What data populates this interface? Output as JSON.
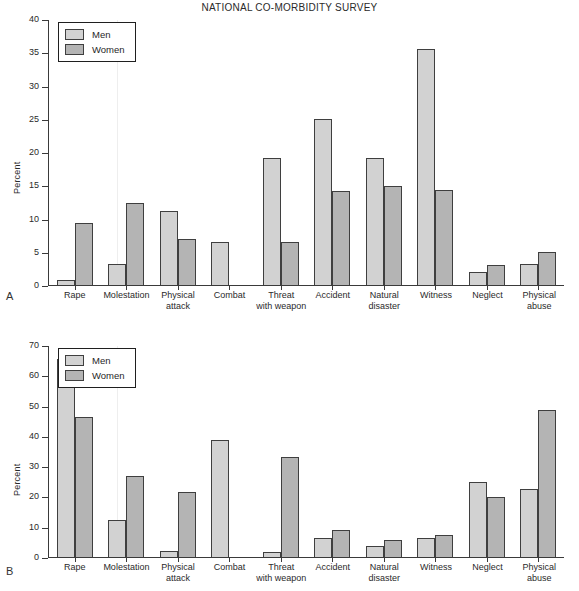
{
  "figure": {
    "title": "NATIONAL CO-MORBIDITY SURVEY",
    "panel_a_letter": "A",
    "panel_b_letter": "B",
    "colors": {
      "men": "#d2d2d2",
      "women": "#b4b4b4",
      "axis": "#3a3a3a",
      "text": "#2a2a2a",
      "background": "#ffffff"
    }
  },
  "legend": {
    "men_label": "Men",
    "women_label": "Women"
  },
  "chart_data": [
    {
      "type": "bar",
      "panel": "A",
      "title": "NATIONAL CO-MORBIDITY SURVEY",
      "xlabel": "",
      "ylabel": "Percent",
      "ylim": [
        0,
        40
      ],
      "yticks": [
        0,
        5,
        10,
        15,
        20,
        25,
        30,
        35,
        40
      ],
      "ytick_labels": [
        "0",
        "5",
        "10",
        "15",
        "20",
        "25",
        "30",
        "35",
        "40"
      ],
      "grid": false,
      "legend_position": "upper left",
      "categories": [
        "Rape",
        "Molestation",
        "Physical attack",
        "Combat",
        "Threat with weapon",
        "Accident",
        "Natural disaster",
        "Witness",
        "Neglect",
        "Physical abuse"
      ],
      "category_lines": [
        [
          "Rape"
        ],
        [
          "Molestation"
        ],
        [
          "Physical",
          "attack"
        ],
        [
          "Combat"
        ],
        [
          "Threat",
          "with weapon"
        ],
        [
          "Accident"
        ],
        [
          "Natural",
          "disaster"
        ],
        [
          "Witness"
        ],
        [
          "Neglect"
        ],
        [
          "Physical",
          "abuse"
        ]
      ],
      "series": [
        {
          "name": "Men",
          "values": [
            0.7,
            3.1,
            11.2,
            6.5,
            19.1,
            25.0,
            19.1,
            35.5,
            2.0,
            3.1
          ]
        },
        {
          "name": "Women",
          "values": [
            9.4,
            12.4,
            6.9,
            0,
            6.5,
            14.1,
            14.9,
            14.3,
            3.0,
            4.9
          ]
        }
      ]
    },
    {
      "type": "bar",
      "panel": "B",
      "title": "",
      "xlabel": "",
      "ylabel": "Percent",
      "ylim": [
        0,
        70
      ],
      "yticks": [
        0,
        10,
        20,
        30,
        40,
        50,
        60,
        70
      ],
      "ytick_labels": [
        "0",
        "10",
        "20",
        "30",
        "40",
        "50",
        "60",
        "70"
      ],
      "grid": false,
      "legend_position": "upper left",
      "categories": [
        "Rape",
        "Molestation",
        "Physical attack",
        "Combat",
        "Threat with weapon",
        "Accident",
        "Natural disaster",
        "Witness",
        "Neglect",
        "Physical abuse"
      ],
      "category_lines": [
        [
          "Rape"
        ],
        [
          "Molestation"
        ],
        [
          "Physical",
          "attack"
        ],
        [
          "Combat"
        ],
        [
          "Threat",
          "with weapon"
        ],
        [
          "Accident"
        ],
        [
          "Natural",
          "disaster"
        ],
        [
          "Witness"
        ],
        [
          "Neglect"
        ],
        [
          "Physical",
          "abuse"
        ]
      ],
      "series": [
        {
          "name": "Men",
          "values": [
            65.3,
            12.2,
            2.1,
            38.8,
            1.8,
            6.4,
            3.7,
            6.2,
            24.9,
            22.5
          ]
        },
        {
          "name": "Women",
          "values": [
            46.2,
            26.6,
            21.4,
            0,
            33.0,
            8.9,
            5.6,
            7.2,
            19.9,
            48.5
          ]
        }
      ]
    }
  ]
}
